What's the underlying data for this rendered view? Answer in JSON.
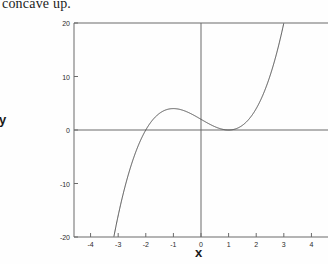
{
  "caption": {
    "text": "concave up."
  },
  "axis_labels": {
    "x": "x",
    "y": "y"
  },
  "chart_data": {
    "type": "line",
    "title": "",
    "subtitle": "",
    "xlabel": "x",
    "ylabel": "y",
    "xlim": [
      -4.6,
      4.6
    ],
    "ylim": [
      -20,
      20
    ],
    "xticks": [
      -4,
      -3,
      -2,
      -1,
      0,
      1,
      2,
      3,
      4
    ],
    "xticklabels": [
      "-4",
      "-3",
      "-2",
      "-1",
      "0",
      "1",
      "2",
      "3",
      "4"
    ],
    "yticks": [
      -20,
      -10,
      0,
      10,
      20
    ],
    "yticklabels": [
      "-20",
      "-10",
      "0",
      "10",
      "20"
    ],
    "grid": false,
    "legend": null,
    "legend_position": "none",
    "axis_lines": {
      "x_axis_at_y": 0,
      "y_axis_at_x": 0,
      "frame_left": true,
      "frame_top": true
    },
    "line_color": "#4a4a4a",
    "axis_color": "#6b6b6b",
    "series": [
      {
        "name": "f(x) = (x-1)^2(x+2)",
        "expression": "x^3 - 3x + 2",
        "x": [
          -3.25,
          -3.2,
          -3.1,
          -3.0,
          -2.9,
          -2.8,
          -2.7,
          -2.6,
          -2.5,
          -2.4,
          -2.3,
          -2.2,
          -2.1,
          -2.0,
          -1.9,
          -1.8,
          -1.7,
          -1.6,
          -1.5,
          -1.4,
          -1.3,
          -1.2,
          -1.1,
          -1.0,
          -0.9,
          -0.8,
          -0.7,
          -0.6,
          -0.5,
          -0.4,
          -0.3,
          -0.2,
          -0.1,
          0.0,
          0.1,
          0.2,
          0.3,
          0.4,
          0.5,
          0.6,
          0.7,
          0.8,
          0.9,
          1.0,
          1.1,
          1.2,
          1.3,
          1.4,
          1.5,
          1.6,
          1.7,
          1.8,
          1.9,
          2.0,
          2.1,
          2.2,
          2.3,
          2.4,
          2.5,
          2.6,
          2.7,
          2.8,
          2.9,
          3.0,
          3.05
        ],
        "y": [
          -22.57,
          -20.97,
          -17.49,
          -16.0,
          -15.69,
          -13.15,
          -10.78,
          -8.58,
          -6.56,
          -4.71,
          -5.03,
          -6.05,
          -4.83,
          0.0,
          1.01,
          1.57,
          2.19,
          2.7,
          2.63,
          3.46,
          3.7,
          3.87,
          3.97,
          4.0,
          3.97,
          3.89,
          3.76,
          3.58,
          3.38,
          3.14,
          2.87,
          2.59,
          2.3,
          2.0,
          1.7,
          1.41,
          1.13,
          0.86,
          0.63,
          0.42,
          0.24,
          0.11,
          0.03,
          0.0,
          0.03,
          0.13,
          0.3,
          0.54,
          0.88,
          1.3,
          1.81,
          2.43,
          3.16,
          4.0,
          4.96,
          6.05,
          7.27,
          8.62,
          10.13,
          11.78,
          13.58,
          15.55,
          17.69,
          20.0,
          21.22
        ]
      }
    ],
    "key_points": [
      {
        "label": "local maximum",
        "x": -1,
        "y": 4
      },
      {
        "label": "local minimum / double root",
        "x": 1,
        "y": 0
      },
      {
        "label": "x-intercept",
        "x": -2,
        "y": 0
      },
      {
        "label": "y-intercept",
        "x": 0,
        "y": 2
      }
    ]
  }
}
